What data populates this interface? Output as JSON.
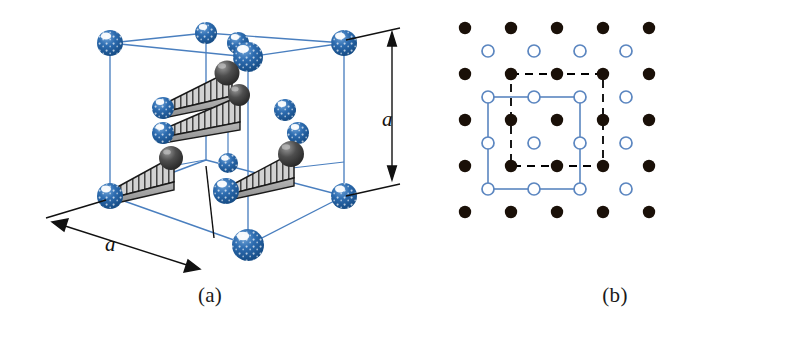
{
  "figure": {
    "width": 810,
    "height": 337,
    "background": "#ffffff"
  },
  "colors": {
    "lattice_blue": "#1f5fa8",
    "sphere_blue_dark": "#16508f",
    "sphere_blue_mid": "#2166ac",
    "sphere_highlight": "#ffffff",
    "cube_edge_blue": "#4a7fbf",
    "dark_sphere": "#3a3a3a",
    "dark_sphere_light": "#8a8a8a",
    "wedge_fill": "#cfcfcf",
    "wedge_stroke": "#1a1a1a",
    "dot_black": "#1a1008",
    "open_circle_stroke": "#5b86c0",
    "dashed_cell": "#000000",
    "solid_cell": "#5b86c0",
    "dimension_line": "#111111",
    "caption_text": "#1a1a1a"
  },
  "panel_a": {
    "caption": "(a)",
    "dimension_vertical_label": "a",
    "dimension_horizontal_label": "a",
    "cube_geometry": {
      "front_bottom_left": [
        110,
        196
      ],
      "front_bottom_right": [
        248,
        245
      ],
      "front_top_left": [
        110,
        43
      ],
      "front_top_right": [
        248,
        92
      ],
      "back_bottom_left": [
        206,
        160
      ],
      "back_bottom_right": [
        344,
        196
      ],
      "back_top_left": [
        206,
        33
      ],
      "back_top_right": [
        344,
        43
      ]
    },
    "blue_atoms": [
      {
        "name": "corner-front-top-left",
        "cx": 110,
        "cy": 43,
        "r": 13
      },
      {
        "name": "corner-back-top-left",
        "cx": 206,
        "cy": 33,
        "r": 11
      },
      {
        "name": "corner-back-top-right",
        "cx": 344,
        "cy": 43,
        "r": 13
      },
      {
        "name": "corner-front-top-right",
        "cx": 248,
        "cy": 57,
        "r": 15
      },
      {
        "name": "edge-top-midpoint",
        "cx": 238,
        "cy": 43,
        "r": 11
      },
      {
        "name": "corner-front-bottom-left",
        "cx": 110,
        "cy": 196,
        "r": 13
      },
      {
        "name": "corner-front-bottom-mid",
        "cx": 222,
        "cy": 192,
        "r": 13
      },
      {
        "name": "corner-back-bottom-right",
        "cx": 344,
        "cy": 196,
        "r": 13
      },
      {
        "name": "corner-front-bottom-ctr",
        "cx": 248,
        "cy": 245,
        "r": 16
      },
      {
        "name": "interior-atom-left-upper",
        "cx": 164,
        "cy": 108,
        "r": 11
      },
      {
        "name": "interior-atom-left-lower",
        "cx": 164,
        "cy": 133,
        "r": 11
      },
      {
        "name": "interior-atom-right-up",
        "cx": 285,
        "cy": 110,
        "r": 11
      },
      {
        "name": "interior-atom-right-low",
        "cx": 297,
        "cy": 132,
        "r": 11
      },
      {
        "name": "interior-atom-center",
        "cx": 228,
        "cy": 163,
        "r": 10
      }
    ],
    "dark_atoms": [
      {
        "name": "dark-atom-upper-wedge-a",
        "cx": 226,
        "cy": 74,
        "r": 12
      },
      {
        "name": "dark-atom-upper-wedge-b",
        "cx": 238,
        "cy": 95,
        "r": 11
      },
      {
        "name": "dark-atom-left-wedge",
        "cx": 170,
        "cy": 159,
        "r": 12
      },
      {
        "name": "dark-atom-right-wedge",
        "cx": 290,
        "cy": 155,
        "r": 13
      }
    ],
    "wedges": [
      {
        "name": "wedge-upper",
        "apex": [
          164,
          108
        ],
        "tip": [
          231,
          80
        ],
        "hatch_count": 9
      },
      {
        "name": "wedge-upper-lower",
        "apex": [
          164,
          133
        ],
        "tip": [
          238,
          100
        ],
        "hatch_count": 9
      },
      {
        "name": "wedge-left",
        "apex": [
          112,
          194
        ],
        "tip": [
          172,
          163
        ],
        "hatch_count": 8
      },
      {
        "name": "wedge-right",
        "apex": [
          230,
          190
        ],
        "tip": [
          292,
          160
        ],
        "hatch_count": 8
      }
    ]
  },
  "panel_b": {
    "caption": "(b)",
    "grid": {
      "origin_x": 45,
      "origin_y": 28,
      "spacing": 46,
      "filled_rows": 5,
      "filled_cols": 5,
      "open_rows": 4,
      "open_cols": 4,
      "open_offset": 23
    },
    "filled_circle_radius": 6,
    "open_circle_radius": 6,
    "dashed_cell": {
      "name": "dashed-unit-cell",
      "x1": 91,
      "y1": 74,
      "x2": 183,
      "y2": 166,
      "style": "dashed",
      "corners_on": "filled-circles"
    },
    "solid_cell": {
      "name": "solid-unit-cell",
      "x1": 68,
      "y1": 97,
      "x2": 160,
      "y2": 189,
      "style": "solid",
      "corners_on": "open-circles"
    },
    "legend": {
      "filled_circle_meaning": "lattice point of one sublattice",
      "open_circle_meaning": "lattice point of interleaved sublattice"
    }
  }
}
